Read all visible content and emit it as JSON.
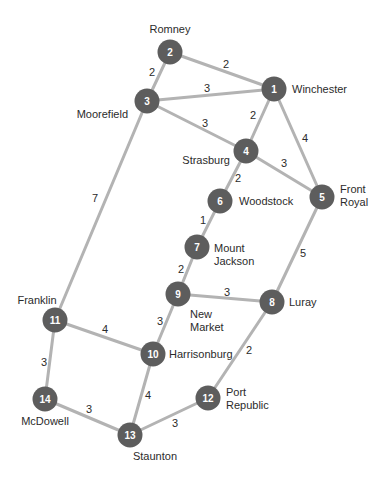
{
  "graph": {
    "colors": {
      "edge": "#b3b3b3",
      "node": "#5d5d5d",
      "node_text": "#ffffff",
      "label": "#2b2b2b"
    },
    "nodes": [
      {
        "id": "1",
        "city": "Winchester",
        "x": 274,
        "y": 89,
        "label_lines": [
          "Winchester"
        ],
        "lx": 292,
        "ly": 93,
        "anchor": "start"
      },
      {
        "id": "2",
        "city": "Romney",
        "x": 170,
        "y": 52,
        "label_lines": [
          "Romney"
        ],
        "lx": 170,
        "ly": 33,
        "anchor": "middle"
      },
      {
        "id": "3",
        "city": "Moorefield",
        "x": 147,
        "y": 101,
        "label_lines": [
          "Moorefield"
        ],
        "lx": 128,
        "ly": 118,
        "anchor": "end"
      },
      {
        "id": "4",
        "city": "Strasburg",
        "x": 246,
        "y": 151,
        "label_lines": [
          "Strasburg"
        ],
        "lx": 230,
        "ly": 164,
        "anchor": "end"
      },
      {
        "id": "5",
        "city": "Front Royal",
        "x": 322,
        "y": 197,
        "label_lines": [
          "Front",
          "Royal"
        ],
        "lx": 340,
        "ly": 193,
        "anchor": "start"
      },
      {
        "id": "6",
        "city": "Woodstock",
        "x": 220,
        "y": 201,
        "label_lines": [
          "Woodstock"
        ],
        "lx": 239,
        "ly": 205,
        "anchor": "start"
      },
      {
        "id": "7",
        "city": "Mount Jackson",
        "x": 197,
        "y": 247,
        "label_lines": [
          "Mount",
          "Jackson"
        ],
        "lx": 214,
        "ly": 252,
        "anchor": "start"
      },
      {
        "id": "8",
        "city": "Luray",
        "x": 272,
        "y": 302,
        "label_lines": [
          "Luray"
        ],
        "lx": 289,
        "ly": 306,
        "anchor": "start"
      },
      {
        "id": "9",
        "city": "New Market",
        "x": 178,
        "y": 294,
        "label_lines": [
          "New",
          "Market"
        ],
        "lx": 190,
        "ly": 318,
        "anchor": "start"
      },
      {
        "id": "10",
        "city": "Harrisonburg",
        "x": 153,
        "y": 354,
        "label_lines": [
          "Harrisonburg"
        ],
        "lx": 169,
        "ly": 358,
        "anchor": "start"
      },
      {
        "id": "11",
        "city": "Franklin",
        "x": 55,
        "y": 320,
        "label_lines": [
          "Franklin"
        ],
        "lx": 37,
        "ly": 304,
        "anchor": "middle"
      },
      {
        "id": "12",
        "city": "Port Republic",
        "x": 208,
        "y": 398,
        "label_lines": [
          "Port",
          "Republic"
        ],
        "lx": 226,
        "ly": 396,
        "anchor": "start"
      },
      {
        "id": "13",
        "city": "Staunton",
        "x": 130,
        "y": 435,
        "label_lines": [
          "Staunton"
        ],
        "lx": 155,
        "ly": 460,
        "anchor": "middle"
      },
      {
        "id": "14",
        "city": "McDowell",
        "x": 45,
        "y": 399,
        "label_lines": [
          "McDowell"
        ],
        "lx": 45,
        "ly": 425,
        "anchor": "middle"
      }
    ],
    "edges": [
      {
        "from": "1",
        "to": "2",
        "weight": "2",
        "wx": 226,
        "wy": 68
      },
      {
        "from": "1",
        "to": "3",
        "weight": "3",
        "wx": 207,
        "wy": 92
      },
      {
        "from": "1",
        "to": "4",
        "weight": "2",
        "wx": 253,
        "wy": 119
      },
      {
        "from": "1",
        "to": "5",
        "weight": "4",
        "wx": 305,
        "wy": 142
      },
      {
        "from": "2",
        "to": "3",
        "weight": "2",
        "wx": 152,
        "wy": 76
      },
      {
        "from": "3",
        "to": "4",
        "weight": "3",
        "wx": 205,
        "wy": 127
      },
      {
        "from": "3",
        "to": "11",
        "weight": "7",
        "wx": 95,
        "wy": 202
      },
      {
        "from": "4",
        "to": "5",
        "weight": "3",
        "wx": 284,
        "wy": 167
      },
      {
        "from": "4",
        "to": "6",
        "weight": "2",
        "wx": 238,
        "wy": 182
      },
      {
        "from": "6",
        "to": "7",
        "weight": "1",
        "wx": 203,
        "wy": 224
      },
      {
        "from": "7",
        "to": "9",
        "weight": "2",
        "wx": 181,
        "wy": 273
      },
      {
        "from": "5",
        "to": "8",
        "weight": "5",
        "wx": 303,
        "wy": 257
      },
      {
        "from": "9",
        "to": "8",
        "weight": "3",
        "wx": 227,
        "wy": 296
      },
      {
        "from": "9",
        "to": "10",
        "weight": "3",
        "wx": 160,
        "wy": 325
      },
      {
        "from": "11",
        "to": "10",
        "weight": "4",
        "wx": 105,
        "wy": 333
      },
      {
        "from": "8",
        "to": "12",
        "weight": "2",
        "wx": 249,
        "wy": 354
      },
      {
        "from": "11",
        "to": "14",
        "weight": "3",
        "wx": 44,
        "wy": 366
      },
      {
        "from": "10",
        "to": "13",
        "weight": "4",
        "wx": 148,
        "wy": 399
      },
      {
        "from": "14",
        "to": "13",
        "weight": "3",
        "wx": 89,
        "wy": 413
      },
      {
        "from": "13",
        "to": "12",
        "weight": "3",
        "wx": 175,
        "wy": 427
      }
    ]
  }
}
